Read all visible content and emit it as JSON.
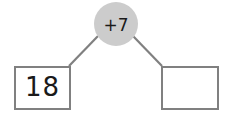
{
  "diagram": {
    "type": "number-bond",
    "background_color": "#ffffff",
    "stroke_color": "#808080",
    "text_color": "#1a1a1a",
    "circle_fill_color": "#cccccc",
    "operation": {
      "label": "+7",
      "operator": "+",
      "operand": 7,
      "shape": "circle"
    },
    "boxes": [
      {
        "name": "left-box",
        "value": "18",
        "filled": true,
        "position": "left"
      },
      {
        "name": "right-box",
        "value": "",
        "filled": false,
        "position": "right"
      }
    ],
    "connectors": [
      {
        "name": "left-connector",
        "from": "operation-circle",
        "to": "left-box"
      },
      {
        "name": "right-connector",
        "from": "operation-circle",
        "to": "right-box"
      }
    ]
  }
}
